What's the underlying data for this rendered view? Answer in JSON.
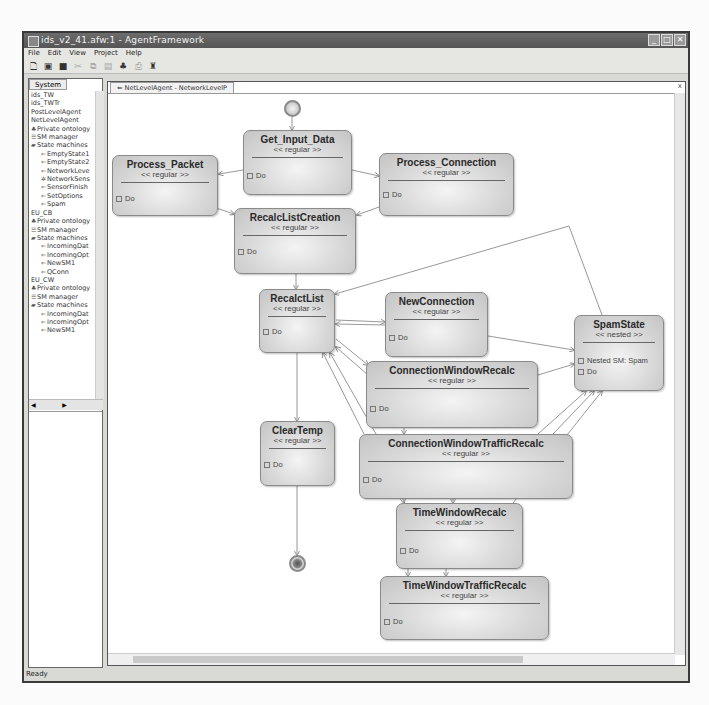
{
  "window": {
    "title": "ids_v2_41.afw:1 - AgentFramework",
    "buttons": [
      "minimize",
      "maximize",
      "close"
    ]
  },
  "menu": [
    "File",
    "Edit",
    "View",
    "Project",
    "Help"
  ],
  "toolbar": {
    "icons": [
      "new-file-icon",
      "open-icon",
      "save-icon",
      "cut-icon",
      "copy-icon",
      "paste-icon",
      "hierarchy-icon",
      "print-icon",
      "pin-icon"
    ]
  },
  "left_panel": {
    "tab": "System",
    "tree": [
      {
        "level": 1,
        "icon": "",
        "label": "ids_TW"
      },
      {
        "level": 1,
        "icon": "",
        "label": "ids_TWTr"
      },
      {
        "level": 1,
        "icon": "",
        "label": "PostLevelAgent"
      },
      {
        "level": 1,
        "icon": "",
        "label": "NetLevelAgent"
      },
      {
        "level": 1,
        "icon": "ontology",
        "label": "Private ontology"
      },
      {
        "level": 1,
        "icon": "sm",
        "label": "SM manager"
      },
      {
        "level": 1,
        "icon": "folder",
        "label": "State machines"
      },
      {
        "level": 2,
        "icon": "sm-item",
        "label": "EmptyState1"
      },
      {
        "level": 2,
        "icon": "sm-item",
        "label": "EmptyState2"
      },
      {
        "level": 2,
        "icon": "sm-item",
        "label": "NetworkLeve"
      },
      {
        "level": 2,
        "icon": "sm-special",
        "label": "NetworkSens"
      },
      {
        "level": 2,
        "icon": "sm-item",
        "label": "SensorFinish"
      },
      {
        "level": 2,
        "icon": "sm-item",
        "label": "SetOptions"
      },
      {
        "level": 2,
        "icon": "sm-item",
        "label": "Spam"
      },
      {
        "level": 1,
        "icon": "",
        "label": "EU_CB"
      },
      {
        "level": 1,
        "icon": "ontology",
        "label": "Private ontology"
      },
      {
        "level": 1,
        "icon": "sm",
        "label": "SM manager"
      },
      {
        "level": 1,
        "icon": "folder",
        "label": "State machines"
      },
      {
        "level": 2,
        "icon": "sm-item",
        "label": "IncomingDat"
      },
      {
        "level": 2,
        "icon": "sm-item",
        "label": "IncomingOpt"
      },
      {
        "level": 2,
        "icon": "sm-item",
        "label": "NewSM1"
      },
      {
        "level": 2,
        "icon": "sm-item",
        "label": "QConn"
      },
      {
        "level": 1,
        "icon": "",
        "label": "EU_CW"
      },
      {
        "level": 1,
        "icon": "ontology",
        "label": "Private ontology"
      },
      {
        "level": 1,
        "icon": "sm",
        "label": "SM manager"
      },
      {
        "level": 1,
        "icon": "folder",
        "label": "State machines"
      },
      {
        "level": 2,
        "icon": "sm-item",
        "label": "IncomingDat"
      },
      {
        "level": 2,
        "icon": "sm-item",
        "label": "IncomingOpt"
      },
      {
        "level": 2,
        "icon": "sm-item",
        "label": "NewSM1"
      }
    ]
  },
  "editor": {
    "tab": "NetLevelAgent - NetworkLevelP",
    "close": "x"
  },
  "diagram": {
    "nodes": [
      {
        "id": "get_input_data",
        "name": "Get_Input_Data",
        "stereotype": "<< regular >>",
        "attrs": [
          "Do"
        ]
      },
      {
        "id": "process_packet",
        "name": "Process_Packet",
        "stereotype": "<< regular >>",
        "attrs": [
          "Do"
        ]
      },
      {
        "id": "process_connection",
        "name": "Process_Connection",
        "stereotype": "<< regular >>",
        "attrs": [
          "Do"
        ]
      },
      {
        "id": "recalc_list_creation",
        "name": "RecalcListCreation",
        "stereotype": "<< regular >>",
        "attrs": [
          "Do"
        ]
      },
      {
        "id": "recalct_list",
        "name": "RecalctList",
        "stereotype": "<< regular >>",
        "attrs": [
          "Do"
        ]
      },
      {
        "id": "new_connection",
        "name": "NewConnection",
        "stereotype": "<< regular >>",
        "attrs": [
          "Do"
        ]
      },
      {
        "id": "spam_state",
        "name": "SpamState",
        "stereotype": "<< nested >>",
        "attrs": [
          "Nested SM: Spam",
          "Do"
        ]
      },
      {
        "id": "connection_window_recalc",
        "name": "ConnectionWindowRecalc",
        "stereotype": "<< regular >>",
        "attrs": [
          "Do"
        ]
      },
      {
        "id": "clear_temp",
        "name": "ClearTemp",
        "stereotype": "<< regular >>",
        "attrs": [
          "Do"
        ]
      },
      {
        "id": "connection_window_traffic_recalc",
        "name": "ConnectionWindowTrafficRecalc",
        "stereotype": "<< regular >>",
        "attrs": [
          "Do"
        ]
      },
      {
        "id": "time_window_recalc",
        "name": "TimeWindowRecalc",
        "stereotype": "<< regular >>",
        "attrs": [
          "Do"
        ]
      },
      {
        "id": "time_window_traffic_recalc",
        "name": "TimeWindowTrafficRecalc",
        "stereotype": "<< regular >>",
        "attrs": [
          "Do"
        ]
      }
    ],
    "pseudostates": [
      "initial",
      "final"
    ]
  },
  "status": "Ready",
  "colors": {
    "titlebar": "#5f5f5f",
    "node_fill": "#d8d8d8",
    "node_border": "#8a8a8a",
    "edge": "#8a8a8a"
  }
}
